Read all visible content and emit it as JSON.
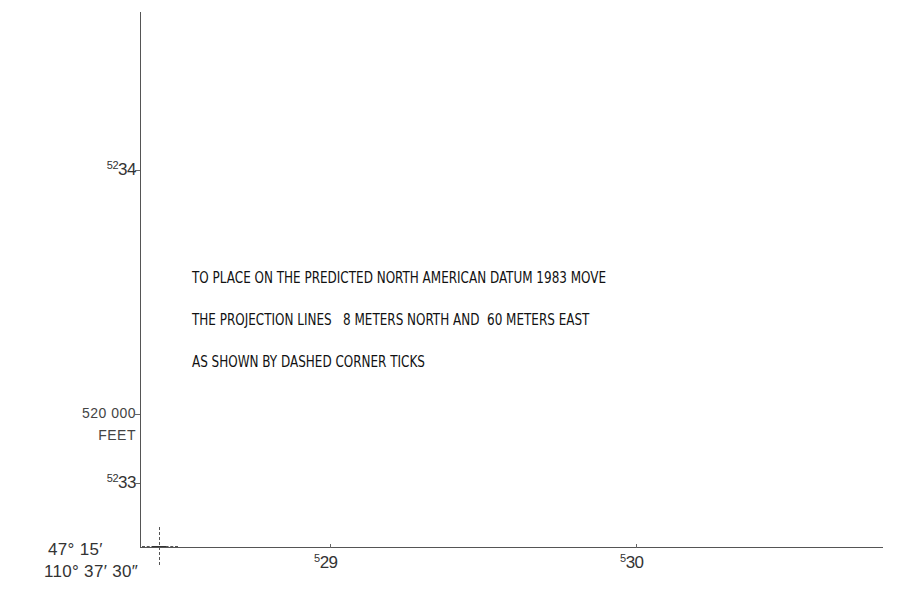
{
  "map": {
    "neatline": {
      "corner": {
        "x": 140,
        "y": 547
      },
      "color": "#555555"
    },
    "northing_labels": [
      {
        "prefix": "52",
        "main": "34",
        "y": 170
      },
      {
        "prefix": "52",
        "main": "33",
        "y": 483
      }
    ],
    "easting_labels": [
      {
        "prefix": "5",
        "main": "29",
        "x": 330
      },
      {
        "prefix": "5",
        "main": "30",
        "x": 636
      }
    ],
    "state_plane": {
      "value": "520 000",
      "unit": "FEET"
    },
    "corner_coordinates": {
      "latitude": "47° 15′",
      "longitude": "110° 37′ 30″"
    },
    "datum_note": {
      "lines": [
        "TO PLACE ON THE PREDICTED NORTH AMERICAN DATUM 1983 MOVE",
        "THE PROJECTION LINES   8 METERS NORTH AND  60 METERS EAST",
        "AS SHOWN BY DASHED CORNER TICKS"
      ]
    },
    "shift": {
      "north_meters": "8",
      "east_meters": "60",
      "datum": "NORTH AMERICAN DATUM 1983"
    }
  }
}
